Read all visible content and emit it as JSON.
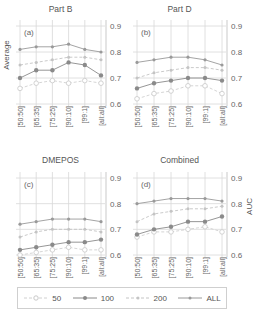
{
  "chart_data": [
    {
      "type": "line",
      "panel_label": "(a)",
      "title": "Part B",
      "categories": [
        "[50:50]",
        "[65:35]",
        "[75:25]",
        "[90:10]",
        "[99:1]",
        "[all:all]"
      ],
      "series": [
        {
          "name": "50",
          "values": [
            0.66,
            0.68,
            0.69,
            0.68,
            0.69,
            0.68
          ]
        },
        {
          "name": "100",
          "values": [
            0.7,
            0.73,
            0.73,
            0.76,
            0.75,
            0.71
          ]
        },
        {
          "name": "200",
          "values": [
            0.75,
            0.76,
            0.77,
            0.78,
            0.78,
            0.77
          ]
        },
        {
          "name": "ALL",
          "values": [
            0.81,
            0.82,
            0.82,
            0.83,
            0.81,
            0.8
          ]
        }
      ],
      "ylabel": "Average",
      "ylim": [
        0.6,
        0.9
      ],
      "yticks": [
        "0.6",
        "0.7",
        "0.8",
        "0.9"
      ],
      "grid": true
    },
    {
      "type": "line",
      "panel_label": "(b)",
      "title": "Part D",
      "categories": [
        "[50:50]",
        "[65:35]",
        "[75:25]",
        "[90:10]",
        "[99:1]",
        "[all:all]"
      ],
      "series": [
        {
          "name": "50",
          "values": [
            0.62,
            0.64,
            0.65,
            0.67,
            0.67,
            0.64
          ]
        },
        {
          "name": "100",
          "values": [
            0.66,
            0.68,
            0.69,
            0.7,
            0.7,
            0.69
          ]
        },
        {
          "name": "200",
          "values": [
            0.7,
            0.72,
            0.73,
            0.74,
            0.74,
            0.73
          ]
        },
        {
          "name": "ALL",
          "values": [
            0.76,
            0.77,
            0.78,
            0.78,
            0.77,
            0.75
          ]
        }
      ],
      "ylabel": "",
      "ylim": [
        0.6,
        0.9
      ],
      "yticks": [
        "0.6",
        "0.7",
        "0.8",
        "0.9"
      ],
      "grid": true
    },
    {
      "type": "line",
      "panel_label": "(c)",
      "title": "DMEPOS",
      "categories": [
        "[50:50]",
        "[65:35]",
        "[75:25]",
        "[90:10]",
        "[99:1]",
        "[all:all]"
      ],
      "series": [
        {
          "name": "50",
          "values": [
            0.6,
            0.61,
            0.62,
            0.63,
            0.62,
            0.62
          ]
        },
        {
          "name": "100",
          "values": [
            0.62,
            0.63,
            0.64,
            0.65,
            0.65,
            0.66
          ]
        },
        {
          "name": "200",
          "values": [
            0.67,
            0.69,
            0.7,
            0.7,
            0.7,
            0.69
          ]
        },
        {
          "name": "ALL",
          "values": [
            0.72,
            0.73,
            0.74,
            0.74,
            0.74,
            0.73
          ]
        }
      ],
      "ylabel": "",
      "ylim": [
        0.6,
        0.9
      ],
      "yticks": [
        "0.6",
        "0.7",
        "0.8",
        "0.9"
      ],
      "grid": true
    },
    {
      "type": "line",
      "panel_label": "(d)",
      "title": "Combined",
      "categories": [
        "[50:50]",
        "[65:35]",
        "[75:25]",
        "[90:10]",
        "[99:1]",
        "[all:all]"
      ],
      "series": [
        {
          "name": "50",
          "values": [
            0.67,
            0.69,
            0.69,
            0.7,
            0.71,
            0.69
          ]
        },
        {
          "name": "100",
          "values": [
            0.68,
            0.7,
            0.71,
            0.73,
            0.73,
            0.75
          ]
        },
        {
          "name": "200",
          "values": [
            0.73,
            0.76,
            0.77,
            0.78,
            0.78,
            0.79
          ]
        },
        {
          "name": "ALL",
          "values": [
            0.8,
            0.81,
            0.82,
            0.82,
            0.82,
            0.81
          ]
        }
      ],
      "ylabel": "AUC",
      "ylim": [
        0.6,
        0.9
      ],
      "yticks": [
        "0.6",
        "0.7",
        "0.8",
        "0.9"
      ],
      "grid": true
    }
  ],
  "legend": {
    "items": [
      {
        "label": "50",
        "style": "dashed-open"
      },
      {
        "label": "100",
        "style": "solid-filled"
      },
      {
        "label": "200",
        "style": "dashed-open"
      },
      {
        "label": "ALL",
        "style": "solid-filled"
      }
    ]
  },
  "colors": {
    "s50": "#d0d0d0",
    "s100": "#8a8a8a",
    "s200": "#c4c4c4",
    "sALL": "#9a9a9a",
    "grid": "#d8d8d8",
    "text": "#555555"
  }
}
